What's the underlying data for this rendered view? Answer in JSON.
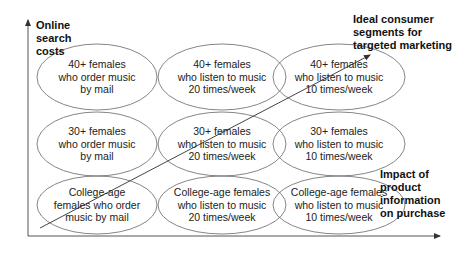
{
  "axes": {
    "y_label": "Online\nsearch\ncosts",
    "x_label": "Impact of\nproduct\ninformation\non purchase"
  },
  "annotation": {
    "ideal_label": "Ideal consumer\nsegments for\ntargeted marketing"
  },
  "grid": {
    "rows": [
      {
        "cells": [
          {
            "text": "40+ females\nwho order music\nby mail"
          },
          {
            "text": "40+ females\nwho listen to music\n20 times/week"
          },
          {
            "text": "40+ females\nwho listen to music\n10 times/week"
          }
        ]
      },
      {
        "cells": [
          {
            "text": "30+ females\nwho order music\nby mail"
          },
          {
            "text": "30+ females\nwho listen to music\n20 times/week"
          },
          {
            "text": "30+ females\nwho listen to music\n10 times/week"
          }
        ]
      },
      {
        "cells": [
          {
            "text": "College-age\nfemales who order\nmusic by mail"
          },
          {
            "text": "College-age females\nwho listen to music\n20 times/week"
          },
          {
            "text": "College-age females\nwho listen to music\n10 times/week"
          }
        ]
      }
    ]
  },
  "colors": {
    "line": "#555555",
    "text": "#222222"
  }
}
